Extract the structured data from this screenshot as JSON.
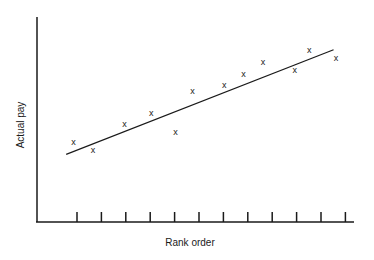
{
  "chart_data": {
    "type": "scatter",
    "title": "",
    "xlabel": "Rank order",
    "ylabel": "Actual pay",
    "x_ticks_count": 12,
    "x_tick_labels": [],
    "y_tick_labels": [],
    "marker": "x",
    "grid": false,
    "legend": null,
    "points": [
      {
        "x": 1.5,
        "y": 3.9
      },
      {
        "x": 2.3,
        "y": 3.5
      },
      {
        "x": 3.6,
        "y": 4.8
      },
      {
        "x": 4.7,
        "y": 5.3
      },
      {
        "x": 5.7,
        "y": 4.4
      },
      {
        "x": 6.4,
        "y": 6.4
      },
      {
        "x": 7.7,
        "y": 6.7
      },
      {
        "x": 8.5,
        "y": 7.2
      },
      {
        "x": 9.3,
        "y": 7.8
      },
      {
        "x": 10.6,
        "y": 7.4
      },
      {
        "x": 11.2,
        "y": 8.4
      },
      {
        "x": 12.3,
        "y": 8.0
      }
    ],
    "trend_line": {
      "x_start": 1.2,
      "y_start": 3.3,
      "x_end": 12.2,
      "y_end": 8.4
    },
    "xlim": [
      0,
      13
    ],
    "ylim": [
      0,
      10
    ]
  },
  "labels": {
    "x_axis": "Rank order",
    "y_axis": "Actual pay",
    "marker_glyph": "x"
  }
}
